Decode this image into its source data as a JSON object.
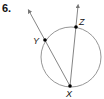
{
  "problem": {
    "number": "6."
  },
  "diagram": {
    "circle": {
      "cx": 71,
      "cy": 57,
      "r": 30,
      "stroke": "#8a8a8a"
    },
    "points": [
      {
        "name": "X",
        "x": 70,
        "y": 86,
        "label_x": 66,
        "label_y": 97
      },
      {
        "name": "Y",
        "x": 45,
        "y": 40,
        "label_x": 33,
        "label_y": 44
      },
      {
        "name": "Z",
        "x": 76,
        "y": 27,
        "label_x": 79,
        "label_y": 25
      }
    ],
    "rays": [
      {
        "name": "ray-XY",
        "from": "X",
        "through": "Y",
        "end_x": 29,
        "end_y": 11
      },
      {
        "name": "ray-XZ",
        "from": "X",
        "through": "Z",
        "end_x": 78,
        "end_y": 6
      }
    ],
    "line_color": "#777777",
    "point_color": "#000000"
  }
}
